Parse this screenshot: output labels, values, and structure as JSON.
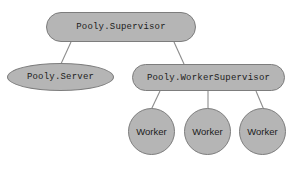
{
  "diagram": {
    "background_color": "#ffffff",
    "node_fill_color": "#b5b5b5",
    "node_border_color": "#7d7d7d",
    "edge_color": "#8c8c8c",
    "text_color": "#1c1c1c",
    "nodes": [
      {
        "id": "supervisor",
        "label": "Pooly.Supervisor",
        "shape": "stadium"
      },
      {
        "id": "server",
        "label": "Pooly.Server",
        "shape": "ellipse"
      },
      {
        "id": "worker_sup",
        "label": "Pooly.WorkerSupervisor",
        "shape": "stadium"
      },
      {
        "id": "worker_1",
        "label": "Worker",
        "shape": "circle"
      },
      {
        "id": "worker_2",
        "label": "Worker",
        "shape": "circle"
      },
      {
        "id": "worker_3",
        "label": "Worker",
        "shape": "circle"
      }
    ],
    "edges": [
      {
        "from": "supervisor",
        "to": "server"
      },
      {
        "from": "supervisor",
        "to": "worker_sup"
      },
      {
        "from": "worker_sup",
        "to": "worker_1"
      },
      {
        "from": "worker_sup",
        "to": "worker_2"
      },
      {
        "from": "worker_sup",
        "to": "worker_3"
      }
    ]
  }
}
